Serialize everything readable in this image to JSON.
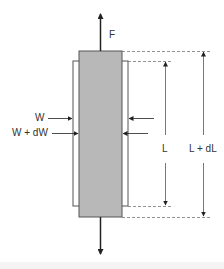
{
  "diagram": {
    "labels": {
      "force": "F",
      "width_original": "W",
      "width_changed": "W + dW",
      "length_original": "L",
      "length_changed": "L + dL"
    },
    "colors": {
      "bar_fill": "#b8b8b8",
      "bar_stroke": "#555555",
      "outline_stroke": "#555555",
      "arrow": "#222222",
      "dimension_line": "#555555",
      "dashed": "#777777",
      "text": "#333333"
    },
    "shapes": {
      "deformed_bar": {
        "x": 79,
        "y": 51,
        "width": 43,
        "height": 166
      },
      "original_outline": {
        "x": 73,
        "y": 61,
        "width": 55,
        "height": 145
      }
    }
  }
}
